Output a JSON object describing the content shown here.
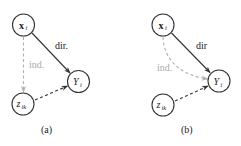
{
  "panels": [
    {
      "caption": "(a)",
      "nodes": {
        "x": {
          "main": "x",
          "sub": "i"
        },
        "y": {
          "main": "Y",
          "sub": "i"
        },
        "z": {
          "main": "z",
          "sub": "ik"
        }
      },
      "edges": {
        "direct_label": "dir.",
        "indirect_label": "ind."
      }
    },
    {
      "caption": "(b)",
      "nodes": {
        "x": {
          "main": "x",
          "sub": "i"
        },
        "y": {
          "main": "Y",
          "sub": "i"
        },
        "z": {
          "main": "z",
          "sub": "ik"
        }
      },
      "edges": {
        "direct_label": "dir",
        "indirect_label": "ind."
      }
    }
  ],
  "colors": {
    "node_stroke": "#333333",
    "direct_edge": "#333333",
    "indirect_edge": "#b0b0b0"
  }
}
